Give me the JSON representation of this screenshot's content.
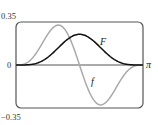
{
  "chart_data": {
    "type": "line",
    "title": "",
    "xlabel": "",
    "ylabel": "",
    "xlim": [
      0,
      3.14159
    ],
    "ylim": [
      -0.35,
      0.35
    ],
    "x_tick_labels": [
      "0",
      "π"
    ],
    "y_tick_labels": [
      "0.35",
      "0",
      "−0.35"
    ],
    "grid": false,
    "legend": "inline curve labels",
    "series": [
      {
        "name": "F",
        "color": "#111111",
        "expression": "sin^4(x)/4",
        "x": [
          0,
          0.3927,
          0.7854,
          1.1781,
          1.5708,
          1.9635,
          2.3562,
          2.7489,
          3.1416
        ],
        "values": [
          0,
          0.0005,
          0.0625,
          0.182,
          0.25,
          0.182,
          0.0625,
          0.0005,
          0
        ]
      },
      {
        "name": "f",
        "color": "#aaaaaa",
        "expression": "sin^3(x)cos(x)",
        "x": [
          0,
          0.3927,
          0.7854,
          1.0472,
          1.1781,
          1.5708,
          1.9635,
          2.0944,
          2.3562,
          2.7489,
          3.1416
        ],
        "values": [
          0,
          0.0517,
          0.25,
          0.3248,
          0.3018,
          0,
          -0.3018,
          -0.3248,
          -0.25,
          -0.0517,
          0
        ]
      }
    ],
    "annotations": [
      {
        "text": "F",
        "near": "black curve, right of peak"
      },
      {
        "text": "f",
        "near": "gray curve, descending below axis"
      }
    ]
  },
  "labels": {
    "y_top": "0.35",
    "y_zero": "0",
    "y_bottom": "−0.35",
    "x_end": "π",
    "curve_F": "F",
    "curve_f": "f"
  },
  "colors": {
    "frame": "#555555",
    "axis": "#555555",
    "F": "#111111",
    "f": "#aaaaaa"
  }
}
